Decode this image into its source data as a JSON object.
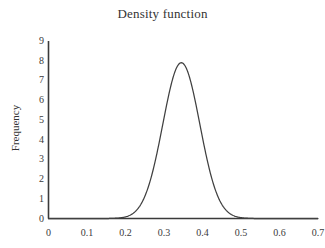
{
  "chart_data": {
    "type": "line",
    "title": "Density function",
    "xlabel": "",
    "ylabel": "Frequency",
    "xlim": [
      0,
      0.7
    ],
    "ylim": [
      0,
      9
    ],
    "grid": false,
    "legend": null,
    "legend_position": "none",
    "series": [
      {
        "name": "Density function",
        "color": "#404040",
        "distribution": "normal",
        "mean": 0.345,
        "sigma": 0.048,
        "peak_value": 7.9,
        "peak_x": 0.345,
        "x": [
          0.0,
          0.05,
          0.1,
          0.15,
          0.18,
          0.2,
          0.22,
          0.24,
          0.25,
          0.26,
          0.27,
          0.28,
          0.29,
          0.3,
          0.31,
          0.32,
          0.33,
          0.34,
          0.345,
          0.35,
          0.36,
          0.37,
          0.38,
          0.39,
          0.4,
          0.41,
          0.42,
          0.43,
          0.44,
          0.45,
          0.46,
          0.47,
          0.48,
          0.5,
          0.52,
          0.55,
          0.6,
          0.65,
          0.7
        ],
        "y": [
          0.0,
          0.0,
          0.0,
          0.0,
          0.02,
          0.06,
          0.17,
          0.4,
          0.6,
          0.87,
          1.22,
          1.66,
          2.2,
          2.83,
          3.54,
          4.31,
          5.09,
          5.84,
          6.19,
          6.52,
          7.09,
          7.5,
          7.75,
          7.83,
          7.72,
          7.45,
          7.02,
          6.47,
          5.83,
          5.13,
          4.41,
          3.7,
          3.03,
          1.9,
          1.07,
          0.33,
          0.01,
          0.0,
          0.0
        ]
      }
    ],
    "y_ticks": [
      0,
      1,
      2,
      3,
      4,
      5,
      6,
      7,
      8,
      9
    ],
    "y_tick_labels": [
      "0",
      "1",
      "2",
      "3",
      "4",
      "5",
      "6",
      "7",
      "8",
      "9"
    ],
    "x_ticks": [
      0,
      0.1,
      0.2,
      0.3,
      0.4,
      0.5,
      0.6,
      0.7
    ],
    "x_tick_labels": [
      "0",
      "0.1",
      "0.2",
      "0.3",
      "0.4",
      "0.5",
      "0.6",
      "0.7"
    ],
    "axis_color": "#3a3a3a",
    "background_color": "#ffffff"
  }
}
